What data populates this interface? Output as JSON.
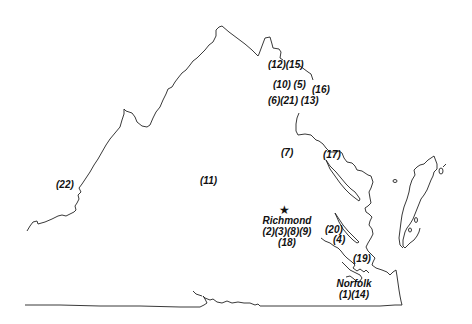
{
  "map": {
    "region": "Virginia",
    "outline_color": "#222222",
    "cities": {
      "richmond": {
        "name": "Richmond",
        "codes_line1": "(2)(3)(8)(9)",
        "codes_line2": "(18)",
        "marker": "★"
      },
      "norfolk": {
        "name": "Norfolk",
        "codes_line1": "(1)(14)"
      }
    },
    "labels": {
      "l12_15": "(12)(15)",
      "l10_5": "(10) (5)",
      "l16": "(16)",
      "l6_21_13": "(6)(21) (13)",
      "l7": "(7)",
      "l17": "(17)",
      "l11": "(11)",
      "l22": "(22)",
      "l20": "(20)",
      "l4": "(4)",
      "l19": "(19)"
    }
  }
}
